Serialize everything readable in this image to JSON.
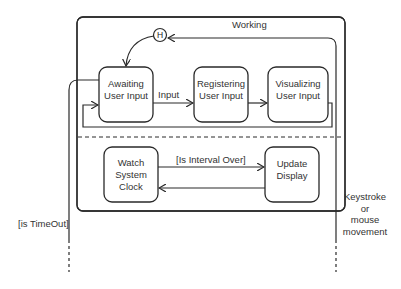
{
  "diagram": {
    "type": "UML state machine",
    "composite_state": {
      "title": "Working"
    },
    "history_pseudostate": {
      "label": "H"
    },
    "upper_region": {
      "states": [
        {
          "id": "awaiting",
          "label_lines": [
            "Awaiting",
            "User Input"
          ]
        },
        {
          "id": "registering",
          "label_lines": [
            "Registering",
            "User Input"
          ]
        },
        {
          "id": "visualizing",
          "label_lines": [
            "Visualizing",
            "User Input"
          ]
        }
      ],
      "transitions": [
        {
          "from": "awaiting",
          "to": "registering",
          "label": "Input"
        },
        {
          "from": "registering",
          "to": "visualizing",
          "label": ""
        },
        {
          "from": "visualizing",
          "to": "awaiting",
          "label": ""
        },
        {
          "from": "history",
          "to": "awaiting",
          "label": ""
        }
      ]
    },
    "lower_region": {
      "states": [
        {
          "id": "watch",
          "label_lines": [
            "Watch",
            "System",
            "Clock"
          ]
        },
        {
          "id": "update",
          "label_lines": [
            "Update",
            "Display"
          ]
        }
      ],
      "transitions": [
        {
          "from": "watch",
          "to": "update",
          "label": "[Is Interval Over]"
        },
        {
          "from": "update",
          "to": "watch",
          "label": ""
        }
      ]
    },
    "external_transitions": [
      {
        "label": "[is TimeOut]",
        "from": "awaiting",
        "to": "outside"
      },
      {
        "label_lines": [
          "Keystroke",
          "or",
          "mouse",
          "movement"
        ],
        "from": "outside",
        "to": "history"
      }
    ]
  },
  "colors": {
    "line": "#2a2a2a",
    "text": "#333333",
    "background": "#ffffff"
  }
}
